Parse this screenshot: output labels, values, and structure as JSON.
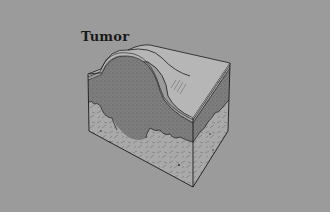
{
  "figure": {
    "label": "Tumor",
    "colors": {
      "background": "#9b9b9b",
      "border": "#ffffff",
      "outline": "#1a1a1a",
      "skin_surface": "#b4b4b4",
      "tumor_fill": "#7e7e7e",
      "dermis_fill": "#a8a8a8"
    }
  }
}
